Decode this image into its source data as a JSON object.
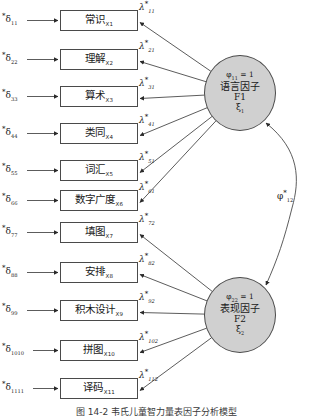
{
  "figure": {
    "type": "sem-path-diagram",
    "caption": "图 14-2 韦氏儿童智力量表因子分析模型",
    "colors": {
      "factor_fill": "#d0d0d0",
      "stroke": "#4a4a4a",
      "box_fill": "#ffffff",
      "text": "#1a1a1a"
    }
  },
  "factors": [
    {
      "id": "F1",
      "variance_label": "φ",
      "variance_sub": "11",
      "variance_value": "= 1",
      "name_cn": "语言因子",
      "code": "F1",
      "symbol": "ξ",
      "symbol_sub": "1"
    },
    {
      "id": "F2",
      "variance_label": "φ",
      "variance_sub": "22",
      "variance_value": "= 1",
      "name_cn": "表现因子",
      "code": "F2",
      "symbol": "ξ",
      "symbol_sub": "2"
    }
  ],
  "covariance": {
    "symbol": "φ",
    "star": "*",
    "sub": "12"
  },
  "indicators": [
    {
      "label": "常识",
      "var": "X1",
      "factor": "F1",
      "delta_sub": "11",
      "lambda_sub": "11"
    },
    {
      "label": "理解",
      "var": "X2",
      "factor": "F1",
      "delta_sub": "22",
      "lambda_sub": "21"
    },
    {
      "label": "算术",
      "var": "X3",
      "factor": "F1",
      "delta_sub": "33",
      "lambda_sub": "31"
    },
    {
      "label": "类同",
      "var": "X4",
      "factor": "F1",
      "delta_sub": "44",
      "lambda_sub": "41"
    },
    {
      "label": "词汇",
      "var": "X5",
      "factor": "F1",
      "delta_sub": "55",
      "lambda_sub": "51"
    },
    {
      "label": "数字广度",
      "var": "X6",
      "factor": "F1",
      "delta_sub": "66",
      "lambda_sub": "61"
    },
    {
      "label": "填图",
      "var": "X7",
      "factor": "F2",
      "delta_sub": "77",
      "lambda_sub": "72"
    },
    {
      "label": "安排",
      "var": "X8",
      "factor": "F2",
      "delta_sub": "88",
      "lambda_sub": "82"
    },
    {
      "label": "积木设计",
      "var": "X9",
      "factor": "F2",
      "delta_sub": "99",
      "lambda_sub": "92"
    },
    {
      "label": "拼图",
      "var": "X10",
      "factor": "F2",
      "delta_sub": "1010",
      "lambda_sub": "102"
    },
    {
      "label": "译码",
      "var": "X11",
      "factor": "F2",
      "delta_sub": "1111",
      "lambda_sub": "112"
    }
  ],
  "symbols": {
    "delta": "δ",
    "lambda": "λ",
    "star": "*"
  }
}
